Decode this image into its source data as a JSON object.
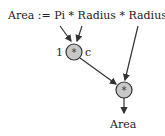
{
  "expression": "Area := Pi * Radius * Radius",
  "node1": {
    "op": "*",
    "left_label": "1",
    "right_label": "c"
  },
  "node2": {
    "op": "*"
  },
  "output": "Area",
  "colors": {
    "node_fill": "#c8c8c8",
    "stroke": "#333333"
  }
}
